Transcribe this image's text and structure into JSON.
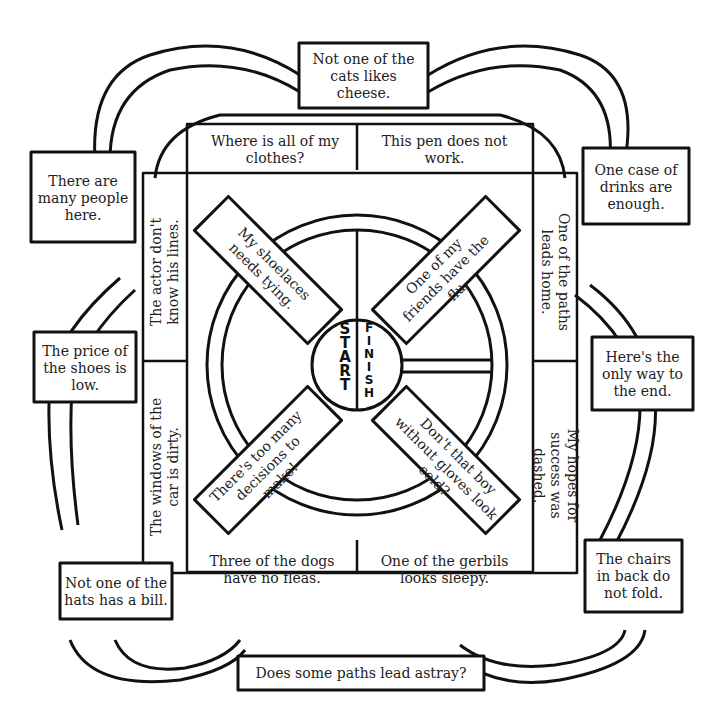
{
  "center": {
    "start": "START",
    "finish": "FINISH"
  },
  "outer_boxes": {
    "top": "Not one of the cats likes cheese.",
    "upper_left": "There are many people here.",
    "mid_left": "The price of the shoes is low.",
    "lower_left": "Not one of the hats has a bill.",
    "upper_right": "One case of drinks are enough.",
    "mid_right": "Here's the only way to the end.",
    "lower_right": "The chairs in back do not fold.",
    "bottom": "Does some paths lead astray?"
  },
  "square_cells": {
    "top_left": "Where is all of my clothes?",
    "top_right": "This pen does not work.",
    "left_upper": "The actor don't know his lines.",
    "left_lower": "The windows of the car is dirty.",
    "right_upper": "One of the paths leads home.",
    "right_lower": "My hopes for success was dashed.",
    "bottom_left": "Three of the dogs have no fleas.",
    "bottom_right": "One of the gerbils looks sleepy."
  },
  "diagonal_bars": {
    "upper_left": "My shoelaces needs tying.",
    "upper_right": "One of my friends have the flu.",
    "lower_left": "There's too many decisions to make!",
    "lower_right": "Don't that boy without gloves look cold?"
  },
  "colors": {
    "ink": "#111111",
    "paper": "#ffffff"
  }
}
